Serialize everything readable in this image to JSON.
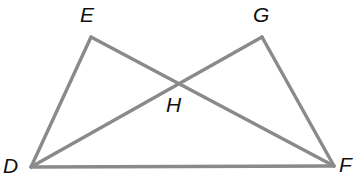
{
  "figure": {
    "background_color": "#ffffff",
    "line_color": "#8a8a8a",
    "label_color": "#111111",
    "stroke_width": 3.4,
    "width": 361,
    "height": 188
  },
  "points": [
    {
      "id": "D",
      "label": "D",
      "x": 31,
      "y": 167,
      "label_x": 3,
      "label_y": 155
    },
    {
      "id": "E",
      "label": "E",
      "x": 91,
      "y": 37,
      "label_x": 80,
      "label_y": 4
    },
    {
      "id": "G",
      "label": "G",
      "x": 262,
      "y": 37,
      "label_x": 253,
      "label_y": 4
    },
    {
      "id": "F",
      "label": "F",
      "x": 334,
      "y": 166,
      "label_x": 339,
      "label_y": 154
    },
    {
      "id": "H",
      "label": "H",
      "x": 175,
      "y": 84,
      "label_x": 166,
      "label_y": 94
    }
  ],
  "segments": [
    {
      "id": "DE",
      "from": "D",
      "to": "E"
    },
    {
      "id": "EF",
      "from": "E",
      "to": "F"
    },
    {
      "id": "DG",
      "from": "D",
      "to": "G"
    },
    {
      "id": "GF",
      "from": "G",
      "to": "F"
    },
    {
      "id": "DF",
      "from": "D",
      "to": "F"
    }
  ]
}
